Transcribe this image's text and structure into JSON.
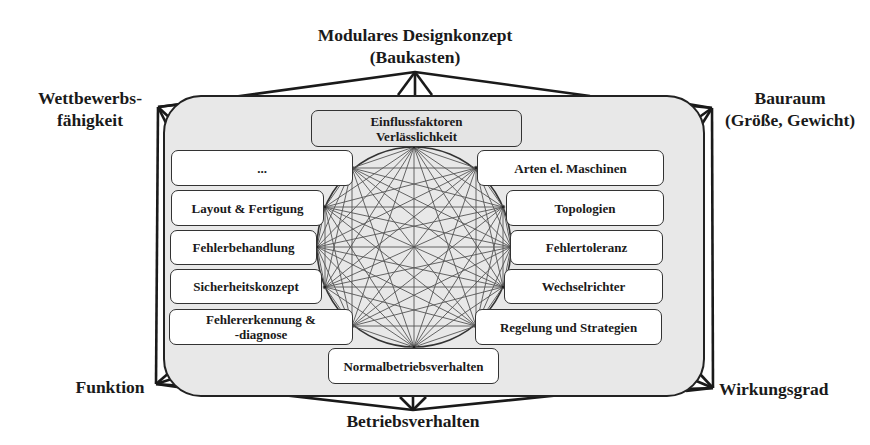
{
  "diagram": {
    "title": "Einflussfaktoren Verlässlichkeit",
    "outer_criteria": {
      "top": "Modulares Designkonzept (Baukasten)",
      "top_line1": "Modulares Designkonzept",
      "top_line2": "(Baukasten)",
      "top_left_line1": "Wettbewerbs-",
      "top_left_line2": "fähigkeit",
      "top_right_line1": "Bauraum",
      "top_right_line2": "(Größe, Gewicht)",
      "bottom_left": "Funktion",
      "bottom_right": "Wirkungsgrad",
      "bottom": "Betriebsverhalten"
    },
    "center_top_box": {
      "line1": "Einflussfaktoren",
      "line2": "Verlässlichkeit"
    },
    "center_bottom_box": "Normalbetriebsverhalten",
    "left_boxes": [
      {
        "label": "..."
      },
      {
        "label": "Layout & Fertigung"
      },
      {
        "label": "Fehlerbehandlung"
      },
      {
        "label": "Sicherheitskonzept"
      },
      {
        "label": "Fehlererkennung &",
        "label2": "-diagnose"
      }
    ],
    "right_boxes": [
      {
        "label": "Arten el. Maschinen"
      },
      {
        "label": "Topologien"
      },
      {
        "label": "Fehlertoleranz"
      },
      {
        "label": "Wechselrichter"
      },
      {
        "label": "Regelung und Strategien"
      }
    ],
    "network": {
      "type": "complete-graph",
      "node_count": 12,
      "description": "All influence factors are interconnected with each other"
    }
  },
  "colors": {
    "panel_fill": "#e8e8e8",
    "box_fill": "#ffffff",
    "stroke": "#222222",
    "network_lines": "#555555"
  }
}
